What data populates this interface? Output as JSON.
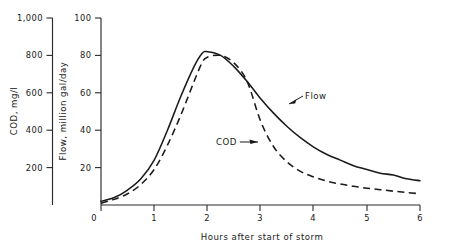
{
  "chart_data": {
    "type": "line",
    "title": "",
    "xlabel": "Hours after start of storm",
    "xlim": [
      0,
      6
    ],
    "xticks": [
      0,
      1,
      2,
      3,
      4,
      5,
      6
    ],
    "xticklabels": [
      "0",
      "1",
      "2",
      "3",
      "4",
      "5",
      "6"
    ],
    "grid": false,
    "legend_position": "inline-annotations",
    "axes": [
      {
        "id": "cod",
        "label": "COD, mg/l",
        "position": "left-outer",
        "lim": [
          0,
          1000
        ],
        "ticks": [
          200,
          400,
          600,
          800,
          1000
        ],
        "ticklabels": [
          "200",
          "400",
          "600",
          "800",
          "1,000"
        ]
      },
      {
        "id": "flow",
        "label": "Flow, million gal/day",
        "position": "left-inner",
        "lim": [
          0,
          100
        ],
        "ticks": [
          0,
          20,
          40,
          60,
          80,
          100
        ],
        "ticklabels": [
          "0",
          "20",
          "40",
          "60",
          "80",
          "100"
        ]
      }
    ],
    "series": [
      {
        "name": "Flow",
        "axis": "flow",
        "style": "solid",
        "units": "million gal/day",
        "x": [
          0,
          0.25,
          0.5,
          0.75,
          1.0,
          1.25,
          1.5,
          1.75,
          1.9,
          2.0,
          2.25,
          2.5,
          2.75,
          3.0,
          3.25,
          3.5,
          3.75,
          4.0,
          4.25,
          4.5,
          4.75,
          5.0,
          5.25,
          5.5,
          5.75,
          6.0
        ],
        "values": [
          2,
          4,
          8,
          14,
          24,
          40,
          58,
          74,
          81,
          82,
          80,
          74,
          66,
          57,
          49,
          42,
          36,
          31,
          27,
          24,
          21,
          19,
          17,
          16,
          14,
          13
        ]
      },
      {
        "name": "COD",
        "axis": "cod",
        "style": "dashed",
        "units": "mg/l",
        "x": [
          0,
          0.25,
          0.5,
          0.75,
          1.0,
          1.25,
          1.5,
          1.75,
          1.9,
          2.0,
          2.25,
          2.5,
          2.75,
          3.0,
          3.25,
          3.5,
          3.75,
          4.0,
          4.25,
          4.5,
          4.75,
          5.0,
          5.25,
          5.5,
          5.75,
          6.0
        ],
        "values": [
          10,
          30,
          60,
          110,
          190,
          320,
          480,
          660,
          760,
          790,
          800,
          760,
          660,
          450,
          310,
          230,
          180,
          150,
          128,
          112,
          100,
          90,
          82,
          74,
          67,
          60
        ]
      }
    ],
    "annotations": [
      {
        "text": "Flow",
        "series": "Flow",
        "at_x": 2.95
      },
      {
        "text": "COD",
        "series": "COD",
        "at_x": 2.95
      }
    ]
  }
}
